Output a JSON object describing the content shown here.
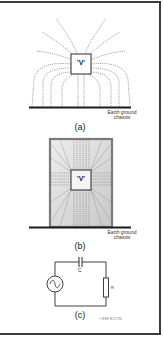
{
  "figure": {
    "panels": [
      {
        "id": "a",
        "label": "(a)",
        "source_label": "'V'",
        "ground_label_line1": "Earth ground",
        "ground_label_line2": "chassis",
        "description": "Field lines from voltage source spreading to earth ground chassis"
      },
      {
        "id": "b",
        "label": "(b)",
        "source_label": "'V'",
        "ground_label_line1": "Earth ground",
        "ground_label_line2": "chassis",
        "description": "Voltage source enclosed in grounded shield box"
      },
      {
        "id": "c",
        "label": "(c)",
        "components": {
          "capacitor": "C",
          "resistor": "R",
          "source": "AC source"
        },
        "copyright": "©IEEE RC/ITM"
      }
    ],
    "colors": {
      "line": "#2a2a2a",
      "field_line": "#555555",
      "shield_fill": "#d8d8d8",
      "shield_border": "#7a7a7a"
    }
  }
}
